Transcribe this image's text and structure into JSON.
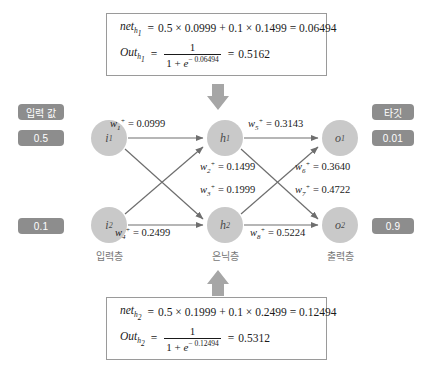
{
  "diagram": {
    "title_note": "neural-network-forward-pass-diagram",
    "colors": {
      "node_fill": "#c9c9c9",
      "pill_fill": "#8d8d8d",
      "edge": "#6e6e6e",
      "block_arrow": "#a6a6a6",
      "box_border": "#9a9a9a"
    }
  },
  "side_labels": {
    "input_label": "입력 값",
    "target_label": "타깃",
    "input_values": [
      "0.5",
      "0.1"
    ],
    "target_values": [
      "0.01",
      "0.9"
    ]
  },
  "layers": {
    "input_caption": "입력층",
    "hidden_caption": "은닉층",
    "output_caption": "출력층"
  },
  "nodes": {
    "i1": {
      "base": "i",
      "sub": "1"
    },
    "i2": {
      "base": "i",
      "sub": "2"
    },
    "h1": {
      "base": "h",
      "sub": "1"
    },
    "h2": {
      "base": "h",
      "sub": "2"
    },
    "o1": {
      "base": "o",
      "sub": "1"
    },
    "o2": {
      "base": "o",
      "sub": "2"
    }
  },
  "weights": [
    {
      "id": "w1",
      "sub": "1",
      "sup": "+",
      "eq": "=",
      "value": "0.0999"
    },
    {
      "id": "w2",
      "sub": "2",
      "sup": "+",
      "eq": "=",
      "value": "0.1499"
    },
    {
      "id": "w3",
      "sub": "3",
      "sup": "+",
      "eq": "=",
      "value": "0.1999"
    },
    {
      "id": "w4",
      "sub": "4",
      "sup": "+",
      "eq": "=",
      "value": "0.2499"
    },
    {
      "id": "w5",
      "sub": "5",
      "sup": "+",
      "eq": "=",
      "value": "0.3143"
    },
    {
      "id": "w6",
      "sub": "6",
      "sup": "+",
      "eq": "=",
      "value": "0.3640"
    },
    {
      "id": "w7",
      "sub": "7",
      "sup": "+",
      "eq": "=",
      "value": "0.4722"
    },
    {
      "id": "w8",
      "sub": "8",
      "sup": "+",
      "eq": "=",
      "value": "0.5224"
    }
  ],
  "formula_top": {
    "net_symbol": "net",
    "net_sub": "h",
    "net_sub2": "1",
    "net_eq": "=",
    "net_expr": "0.5 × 0.0999 + 0.1 × 0.1499 = 0.06494",
    "out_symbol": "Out",
    "out_sub": "h",
    "out_sub2": "1",
    "out_eq": "=",
    "numerator": "1",
    "den_one_plus": "1 + ",
    "den_e": "e",
    "den_exp": "− 0.06494",
    "result_eq": "=",
    "result": "0.5162"
  },
  "formula_bottom": {
    "net_symbol": "net",
    "net_sub": "h",
    "net_sub2": "2",
    "net_eq": "=",
    "net_expr": "0.5 × 0.1999 + 0.1 × 0.2499 = 0.12494",
    "out_symbol": "Out",
    "out_sub": "h",
    "out_sub2": "2",
    "out_eq": "=",
    "numerator": "1",
    "den_one_plus": "1 + ",
    "den_e": "e",
    "den_exp": "− 0.12494",
    "result_eq": "=",
    "result": "0.5312"
  }
}
